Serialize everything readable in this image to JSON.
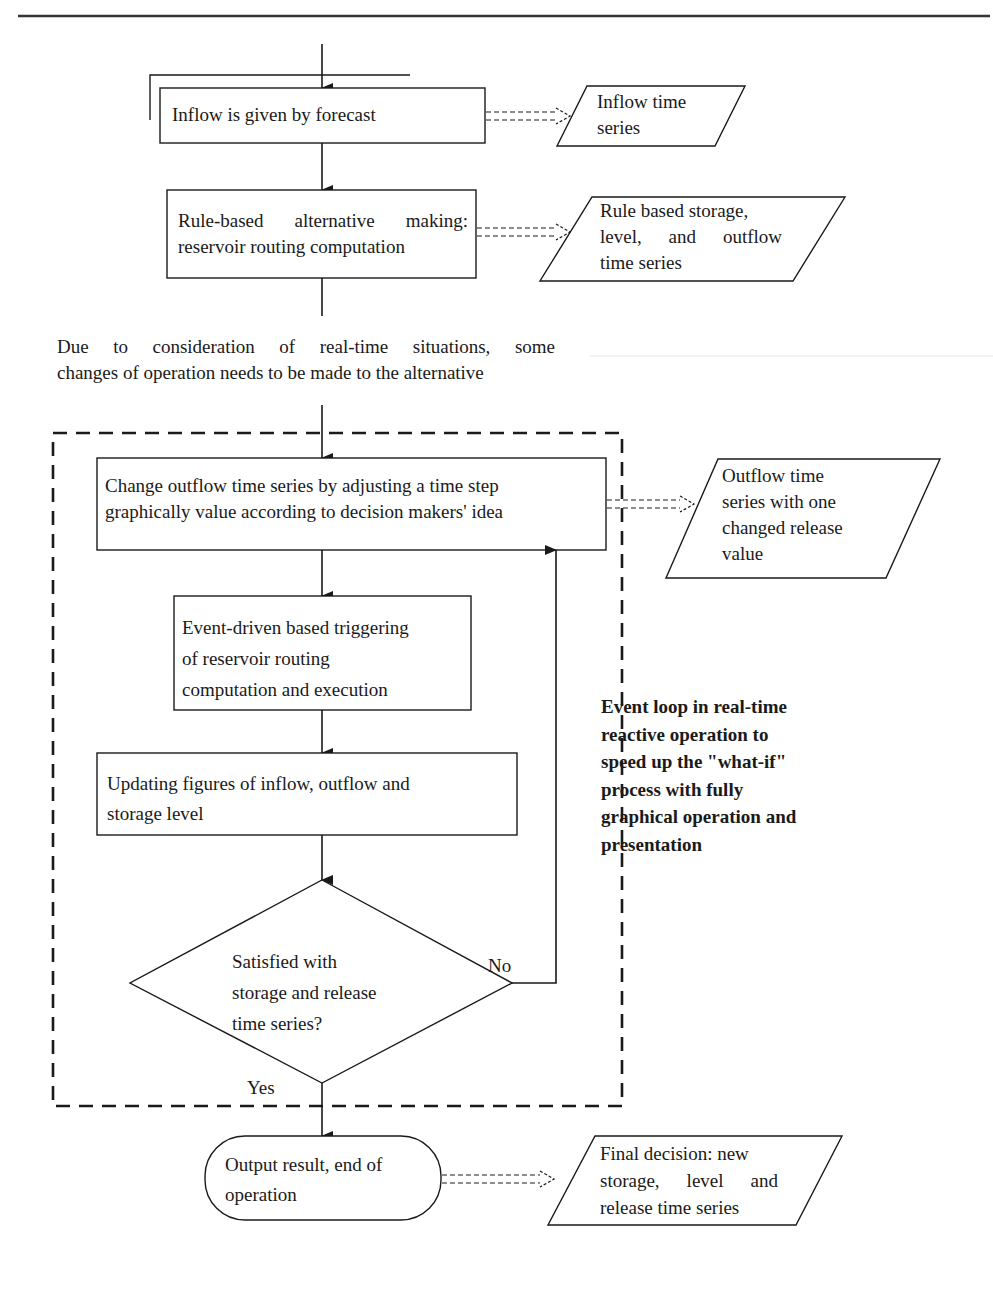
{
  "diagram": {
    "type": "flowchart",
    "colors": {
      "line": "#1a1a1a",
      "background": "#ffffff"
    },
    "top_rule": true,
    "nodes": {
      "inflow_forecast": {
        "shape": "rectangle",
        "label": "Inflow is given by forecast"
      },
      "rule_based": {
        "shape": "rectangle",
        "label_line1": "Rule-based alternative making:",
        "label_line2": "reservoir routing computation"
      },
      "change_outflow": {
        "shape": "rectangle",
        "label_line1": "Change outflow time series by adjusting a time step",
        "label_line2": "graphically value according to decision makers' idea"
      },
      "event_driven": {
        "shape": "rectangle",
        "label_line1": "Event-driven based triggering",
        "label_line2": "of reservoir routing",
        "label_line3": "computation and execution"
      },
      "updating_figures": {
        "shape": "rectangle",
        "label_line1": "Updating figures of inflow, outflow and",
        "label_line2": "storage level"
      },
      "satisfied_decision": {
        "shape": "diamond",
        "label_line1": "Satisfied with",
        "label_line2": "storage and release",
        "label_line3": "time series?"
      },
      "output_result": {
        "shape": "terminal",
        "label_line1": "Output result, end of",
        "label_line2": "operation"
      }
    },
    "data_outputs": {
      "inflow_series": {
        "shape": "parallelogram",
        "label_line1": "Inflow time",
        "label_line2": "series"
      },
      "rule_based_series": {
        "shape": "parallelogram",
        "label_line1": "Rule based storage,",
        "label_line2": "level, and outflow",
        "label_line3": "time series"
      },
      "changed_outflow_series": {
        "shape": "parallelogram",
        "label_line1": "Outflow time",
        "label_line2": "series with one",
        "label_line3": "changed release",
        "label_line4": "value"
      },
      "final_decision": {
        "shape": "parallelogram",
        "label_line1": "Final decision: new",
        "label_line2": "storage, level and",
        "label_line3": "release time series"
      }
    },
    "annotations": {
      "transition_note": {
        "line1": "Due to consideration of real-time situations, some",
        "line2": "changes of operation needs to be made to the alternative"
      },
      "event_loop_note": {
        "line1": "Event loop in real-time",
        "line2": "reactive operation to",
        "line3": "speed up the \"what-if\"",
        "line4": "process with fully",
        "line5": "graphical operation and",
        "line6": "presentation"
      }
    },
    "branch_labels": {
      "no": "No",
      "yes": "Yes"
    },
    "edges": [
      {
        "from": "start",
        "to": "inflow_forecast"
      },
      {
        "from": "inflow_forecast",
        "to": "rule_based"
      },
      {
        "from": "rule_based",
        "to": "change_outflow"
      },
      {
        "from": "change_outflow",
        "to": "event_driven"
      },
      {
        "from": "event_driven",
        "to": "updating_figures"
      },
      {
        "from": "updating_figures",
        "to": "satisfied_decision"
      },
      {
        "from": "satisfied_decision",
        "to": "change_outflow",
        "label": "No"
      },
      {
        "from": "satisfied_decision",
        "to": "output_result",
        "label": "Yes"
      },
      {
        "from": "inflow_forecast",
        "to": "inflow_series",
        "style": "dashed-double"
      },
      {
        "from": "rule_based",
        "to": "rule_based_series",
        "style": "dashed-double"
      },
      {
        "from": "change_outflow",
        "to": "changed_outflow_series",
        "style": "dashed-double"
      },
      {
        "from": "output_result",
        "to": "final_decision",
        "style": "dashed-double"
      }
    ],
    "group": {
      "name": "event-loop",
      "style": "dashed-rectangle"
    }
  }
}
